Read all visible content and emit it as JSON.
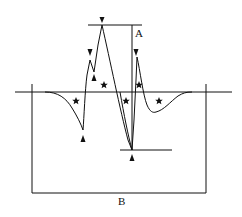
{
  "diagram": {
    "labels": {
      "A": "A",
      "B": "B"
    },
    "colors": {
      "stroke": "#111111",
      "background": "#ffffff"
    },
    "markers": {
      "stars": [
        {
          "x": 76,
          "y": 101
        },
        {
          "x": 104,
          "y": 85
        },
        {
          "x": 126,
          "y": 101
        },
        {
          "x": 139,
          "y": 85
        },
        {
          "x": 159,
          "y": 101
        }
      ],
      "arrowheads_down": [
        {
          "x": 102,
          "y": 20
        },
        {
          "x": 90,
          "y": 52
        },
        {
          "x": 136,
          "y": 52
        }
      ],
      "arrowheads_up": [
        {
          "x": 94,
          "y": 78
        },
        {
          "x": 83,
          "y": 139
        },
        {
          "x": 132,
          "y": 159
        }
      ]
    },
    "lines": {
      "baseline": {
        "x1": 15,
        "x2": 232,
        "y": 92
      },
      "top_reference": {
        "x1": 88,
        "x2": 142,
        "y": 25
      },
      "bottom_reference": {
        "x1": 120,
        "x2": 172,
        "y": 150
      },
      "amplitude_A": {
        "x": 132,
        "y1": 25,
        "y2": 150
      },
      "box_B": {
        "x1": 32,
        "x2": 206,
        "y1": 84,
        "y2": 193
      }
    }
  }
}
